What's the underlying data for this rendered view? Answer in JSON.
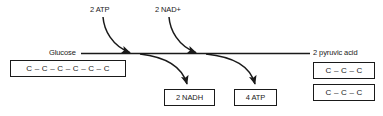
{
  "diagram": {
    "line_color": "#1a1a1a",
    "background": "#ffffff",
    "reactant": {
      "label": "Glucose",
      "formula": "C – C – C – C – C – C"
    },
    "product": {
      "label": "2 pyruvic acid",
      "formula_1": "C – C – C",
      "formula_2": "C – C – C"
    },
    "inputs": [
      {
        "label": "2 ATP"
      },
      {
        "label": "2 NAD+"
      }
    ],
    "outputs": [
      {
        "label": "2 NADH"
      },
      {
        "label": "4 ATP"
      }
    ]
  }
}
